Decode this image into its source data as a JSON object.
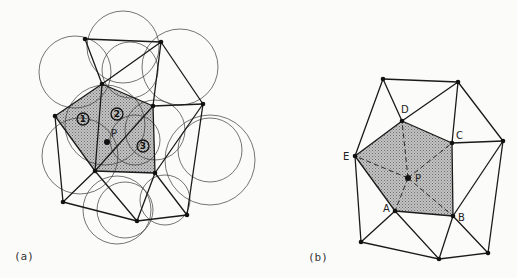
{
  "colors": {
    "background": "#fbfbfa",
    "line": "#1a1a1a",
    "shade": "#a8a8a8"
  },
  "panel_a": {
    "caption": "(a)",
    "point_label": "P",
    "region_labels": [
      "1",
      "2",
      "3"
    ],
    "nodes": [
      [
        85,
        39
      ],
      [
        161,
        42
      ],
      [
        102,
        84
      ],
      [
        153,
        106
      ],
      [
        203,
        104
      ],
      [
        55,
        116
      ],
      [
        95,
        171
      ],
      [
        155,
        173
      ],
      [
        63,
        202
      ],
      [
        137,
        221
      ],
      [
        187,
        215
      ]
    ],
    "shaded_polygon": [
      [
        102,
        84
      ],
      [
        153,
        106
      ],
      [
        155,
        173
      ],
      [
        95,
        171
      ],
      [
        55,
        116
      ]
    ],
    "circles": [
      [
        75,
        72,
        36
      ],
      [
        123,
        47,
        36
      ],
      [
        130,
        70,
        28
      ],
      [
        180,
        67,
        38
      ],
      [
        80,
        156,
        38
      ],
      [
        210,
        160,
        45
      ],
      [
        210,
        150,
        32
      ],
      [
        117,
        210,
        34
      ],
      [
        125,
        210,
        28
      ],
      [
        165,
        200,
        25
      ],
      [
        105,
        125,
        40
      ],
      [
        155,
        130,
        30
      ],
      [
        135,
        140,
        25
      ]
    ],
    "edges": [
      [
        0,
        1
      ],
      [
        0,
        2
      ],
      [
        1,
        2
      ],
      [
        1,
        3
      ],
      [
        1,
        4
      ],
      [
        2,
        3
      ],
      [
        2,
        5
      ],
      [
        2,
        6
      ],
      [
        3,
        4
      ],
      [
        3,
        6
      ],
      [
        3,
        7
      ],
      [
        4,
        7
      ],
      [
        4,
        10
      ],
      [
        5,
        6
      ],
      [
        5,
        8
      ],
      [
        6,
        7
      ],
      [
        6,
        8
      ],
      [
        6,
        9
      ],
      [
        7,
        9
      ],
      [
        7,
        10
      ],
      [
        8,
        9
      ],
      [
        9,
        10
      ]
    ],
    "point": [
      107,
      142
    ]
  },
  "panel_b": {
    "caption": "(b)",
    "point_label": "P",
    "vertex_labels": {
      "A": "A",
      "B": "B",
      "C": "C",
      "D": "D",
      "E": "E"
    },
    "nodes": [
      [
        383,
        79
      ],
      [
        458,
        82
      ],
      [
        402,
        121
      ],
      [
        452,
        143
      ],
      [
        503,
        141
      ],
      [
        355,
        156
      ],
      [
        395,
        211
      ],
      [
        453,
        216
      ],
      [
        361,
        242
      ],
      [
        439,
        259
      ],
      [
        488,
        253
      ]
    ],
    "point": [
      408,
      178
    ],
    "edges": [
      [
        0,
        1
      ],
      [
        0,
        2
      ],
      [
        0,
        5
      ],
      [
        1,
        2
      ],
      [
        1,
        3
      ],
      [
        1,
        4
      ],
      [
        2,
        3
      ],
      [
        2,
        5
      ],
      [
        3,
        4
      ],
      [
        3,
        7
      ],
      [
        4,
        7
      ],
      [
        4,
        10
      ],
      [
        5,
        6
      ],
      [
        5,
        8
      ],
      [
        6,
        7
      ],
      [
        6,
        8
      ],
      [
        6,
        9
      ],
      [
        7,
        9
      ],
      [
        7,
        10
      ],
      [
        9,
        10
      ],
      [
        8,
        9
      ]
    ]
  }
}
